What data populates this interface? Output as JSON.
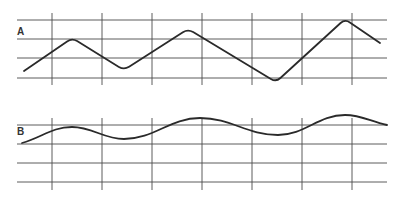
{
  "diagram": {
    "panels": [
      {
        "label": "A",
        "description": "triangular (zigzag) waveform on grid",
        "grid": {
          "h_lines_y": [
            20,
            39,
            58,
            78
          ],
          "v_lines_x": [
            52,
            102,
            152,
            202,
            252,
            302,
            352
          ],
          "x_range": [
            17,
            387
          ],
          "v_span": [
            13,
            85
          ]
        },
        "waveform": {
          "shape": "triangle",
          "points": [
            [
              24,
              71
            ],
            [
              72,
              38
            ],
            [
              124,
              70
            ],
            [
              188,
              29
            ],
            [
              276,
              82
            ],
            [
              345,
              19
            ],
            [
              380,
              43
            ]
          ]
        },
        "label_pos": [
          17,
          35
        ]
      },
      {
        "label": "B",
        "description": "smooth sinusoidal waveform on grid",
        "grid": {
          "h_lines_y": [
            125,
            144,
            163,
            182
          ],
          "v_lines_x": [
            52,
            102,
            152,
            202,
            252,
            302,
            352
          ],
          "x_range": [
            17,
            387
          ],
          "v_span": [
            118,
            190
          ]
        },
        "waveform": {
          "shape": "smooth",
          "points": [
            [
              22,
              143
            ],
            [
              72,
              127
            ],
            [
              124,
              139
            ],
            [
              200,
              118
            ],
            [
              278,
              135
            ],
            [
              345,
              115
            ],
            [
              387,
              125
            ]
          ]
        },
        "label_pos": [
          17,
          135
        ]
      }
    ],
    "colors": {
      "grid": "#4a4a4a",
      "wave": "#2a2a2a",
      "label": "#333333",
      "background": "#ffffff"
    }
  }
}
